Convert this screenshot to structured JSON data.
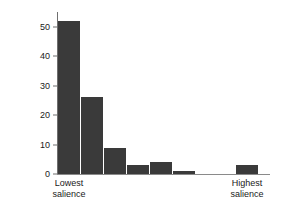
{
  "chart_data": {
    "type": "bar",
    "title": "",
    "xlabel": "",
    "ylabel": "",
    "ylim": [
      0,
      55
    ],
    "yticks": [
      0,
      10,
      20,
      30,
      40,
      50
    ],
    "ytick_labels": [
      "0",
      "10",
      "20",
      "30",
      "40",
      "50"
    ],
    "grid": false,
    "legend": "none",
    "bar_color": "#3a3a3a",
    "axis_color": "#8a8a8a",
    "categories": [
      "1",
      "2",
      "3",
      "4",
      "5",
      "6",
      "7",
      "8",
      "9",
      "10",
      "11"
    ],
    "values": [
      52,
      26,
      9,
      3,
      4,
      1,
      0,
      0,
      0,
      3,
      0
    ],
    "axis_annotations": {
      "left_label_line1": "Lowest",
      "left_label_line2": "salience",
      "right_label_line1": "Highest",
      "right_label_line2": "salience"
    }
  },
  "bars": [
    {
      "name": "bar-1",
      "value": 52,
      "left": 0,
      "width": 22
    },
    {
      "name": "bar-2",
      "value": 26,
      "left": 23,
      "width": 22
    },
    {
      "name": "bar-3",
      "value": 9,
      "left": 46,
      "width": 22
    },
    {
      "name": "bar-4",
      "value": 3,
      "left": 69,
      "width": 22
    },
    {
      "name": "bar-5",
      "value": 4,
      "left": 92,
      "width": 22
    },
    {
      "name": "bar-6",
      "value": 1,
      "left": 115,
      "width": 22
    },
    {
      "name": "bar-7",
      "value": 0,
      "left": 138,
      "width": 22
    },
    {
      "name": "bar-8",
      "value": 0,
      "left": 161,
      "width": 22
    },
    {
      "name": "bar-9",
      "value": 0,
      "left": 184,
      "width": 22
    },
    {
      "name": "bar-10",
      "value": 3,
      "left": 178,
      "width": 22
    },
    {
      "name": "bar-11",
      "value": 0,
      "left": 201,
      "width": 22
    }
  ]
}
